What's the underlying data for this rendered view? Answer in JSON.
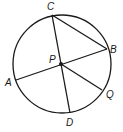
{
  "diagram": {
    "type": "circle-geometry",
    "center_label": "P",
    "points": {
      "C": "C",
      "B": "B",
      "A": "A",
      "D": "D",
      "Q": "Q",
      "P": "P"
    },
    "segments": [
      "CD",
      "AB",
      "CB",
      "PQ"
    ],
    "colors": {
      "stroke": "#1a1a1a",
      "background": "#ffffff"
    }
  }
}
